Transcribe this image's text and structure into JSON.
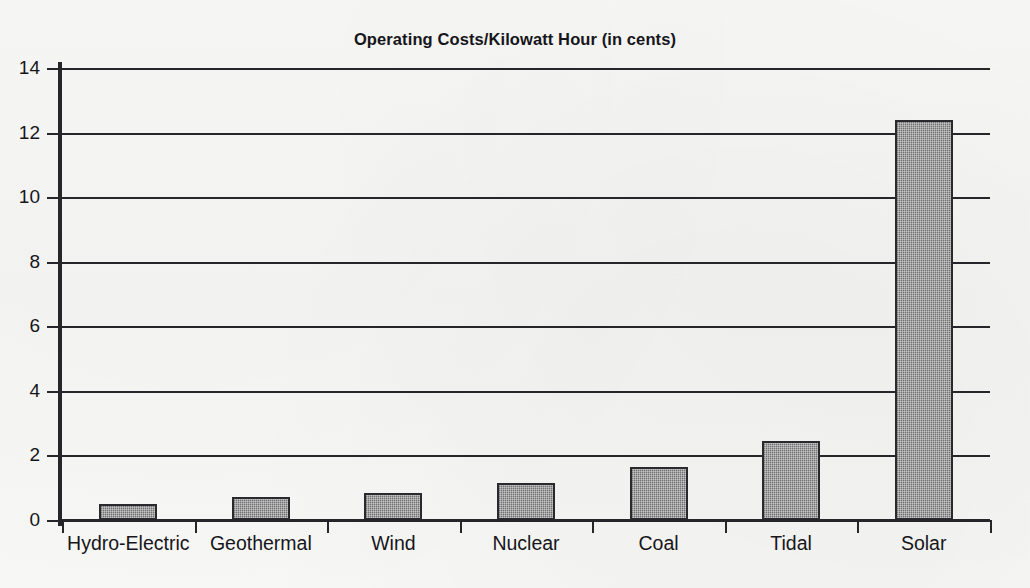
{
  "chart_data": {
    "type": "bar",
    "title": "Operating Costs/Kilowatt Hour (in cents)",
    "xlabel": "",
    "ylabel": "",
    "categories": [
      "Hydro-Electric",
      "Geothermal",
      "Wind",
      "Nuclear",
      "Coal",
      "Tidal",
      "Solar"
    ],
    "values": [
      0.5,
      0.7,
      0.85,
      1.15,
      1.65,
      2.45,
      12.4
    ],
    "ylim": [
      0,
      14
    ],
    "ytick_labels": [
      "0",
      "2",
      "4",
      "6",
      "8",
      "10",
      "12",
      "14"
    ],
    "ytick_values": [
      0,
      2,
      4,
      6,
      8,
      10,
      12,
      14
    ],
    "grid": "horizontal",
    "legend": "none",
    "bar_fill_color": "#929292",
    "bar_border_color": "#2a2a2e",
    "axis_color": "#25252a",
    "background_color": "#f7f7f6"
  }
}
